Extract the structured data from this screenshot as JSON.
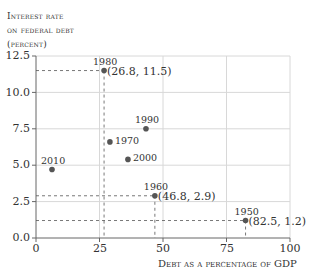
{
  "chart_data": {
    "type": "scatter",
    "title": "",
    "ylabel_lines": [
      "Interest rate",
      "on federal debt",
      "(percent)"
    ],
    "xlabel": "Debt as a percentage of GDP",
    "xlim": [
      0,
      100
    ],
    "ylim": [
      0,
      12.5
    ],
    "xticks": [
      "0",
      "25",
      "50",
      "75",
      "100"
    ],
    "yticks": [
      "0.0",
      "2.5",
      "5.0",
      "7.5",
      "10.0",
      "12.5"
    ],
    "grid": true,
    "legend": null,
    "points": [
      {
        "label": "1950",
        "x": 82.5,
        "y": 1.2,
        "annotation": "(82.5, 1.2)",
        "guides": true
      },
      {
        "label": "1960",
        "x": 46.8,
        "y": 2.9,
        "annotation": "(46.8, 2.9)",
        "guides": true
      },
      {
        "label": "1970",
        "x": 29.1,
        "y": 6.6,
        "annotation": "",
        "guides": false
      },
      {
        "label": "1980",
        "x": 26.8,
        "y": 11.5,
        "annotation": "(26.8, 11.5)",
        "guides": true
      },
      {
        "label": "1990",
        "x": 43.3,
        "y": 7.5,
        "annotation": "",
        "guides": false
      },
      {
        "label": "2000",
        "x": 36.2,
        "y": 5.4,
        "annotation": "",
        "guides": false
      },
      {
        "label": "2010",
        "x": 6.3,
        "y": 4.7,
        "annotation": "",
        "guides": false
      }
    ]
  },
  "colors": {
    "point": "#555555",
    "grid": "#d8d8d8",
    "axis": "#666666",
    "guide": "#555555",
    "text": "#333333"
  }
}
